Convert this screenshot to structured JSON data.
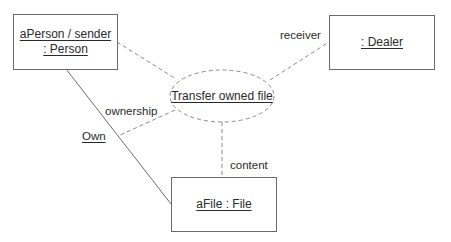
{
  "diagram": {
    "type": "UML collaboration diagram",
    "objects": [
      {
        "id": "person",
        "lines": [
          "aPerson / sender",
          ": Person"
        ]
      },
      {
        "id": "dealer",
        "lines": [
          ": Dealer"
        ]
      },
      {
        "id": "file",
        "lines": [
          "aFile : File"
        ]
      }
    ],
    "collaboration": {
      "label": "Transfer owned file"
    },
    "role_labels": {
      "receiver": "receiver",
      "ownership": "ownership",
      "own": "Own",
      "content": "content"
    },
    "connectors": [
      {
        "from": "person",
        "to": "collaboration",
        "style": "dashed"
      },
      {
        "from": "collaboration",
        "to": "dealer",
        "style": "dashed",
        "role": "receiver"
      },
      {
        "from": "collaboration",
        "to": "Own",
        "style": "dashed",
        "role": "ownership"
      },
      {
        "from": "collaboration",
        "to": "file",
        "style": "dashed",
        "role": "content"
      },
      {
        "from": "person",
        "to": "file",
        "style": "solid",
        "label": "Own"
      }
    ],
    "colors": {
      "line": "#6a6a6a",
      "text": "#2a2a2a",
      "background": "#ffffff"
    }
  }
}
